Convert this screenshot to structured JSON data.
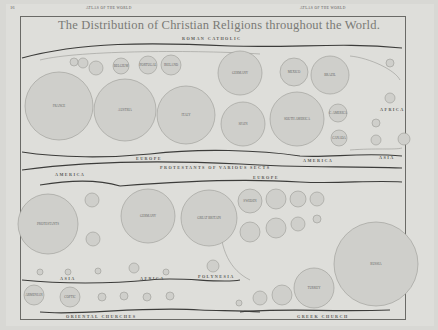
{
  "page": {
    "page_number": "16",
    "running_head_left": "ATLAS OF THE WORLD",
    "running_head_right": "ATLAS OF THE WORLD",
    "title": "The Distribution of Christian Religions throughout the World."
  },
  "sections": {
    "roman_catholic": "ROMAN CATHOLIC",
    "protestants": "PROTESTANTS OF VARIOUS SECTS",
    "oriental": "ORIENTAL CHURCHES",
    "greek": "GREEK CHURCH"
  },
  "region_labels": {
    "rc_europe": "EUROPE",
    "rc_america": "AMERICA",
    "rc_asia": "ASIA",
    "rc_africa": "AFRICA",
    "p_america": "AMERICA",
    "p_europe": "EUROPE",
    "p_asia": "ASIA",
    "p_africa": "AFRICA",
    "p_polynesia": "POLYNESIA"
  },
  "circles": {
    "roman_catholic": [
      {
        "label": "FRANCE",
        "cx": 59,
        "cy": 106,
        "r": 34
      },
      {
        "label": "AUSTRIA",
        "cx": 125,
        "cy": 110,
        "r": 31
      },
      {
        "label": "ITALY",
        "cx": 186,
        "cy": 115,
        "r": 29
      },
      {
        "label": "GERMANY",
        "cx": 240,
        "cy": 73,
        "r": 22
      },
      {
        "label": "SPAIN",
        "cx": 243,
        "cy": 124,
        "r": 22
      },
      {
        "label": "SOUTH AMERICA",
        "cx": 297,
        "cy": 119,
        "r": 27
      },
      {
        "label": "MEXICO",
        "cx": 294,
        "cy": 72,
        "r": 14
      },
      {
        "label": "BRAZIL",
        "cx": 330,
        "cy": 75,
        "r": 19
      },
      {
        "label": "BELGIUM",
        "cx": 121,
        "cy": 66,
        "r": 8
      },
      {
        "label": "PORTUGAL",
        "cx": 148,
        "cy": 65,
        "r": 9
      },
      {
        "label": "IRELAND",
        "cx": 171,
        "cy": 65,
        "r": 10
      },
      {
        "label": "SWITZ.",
        "cx": 96,
        "cy": 68,
        "r": 7
      },
      {
        "label": "",
        "cx": 83,
        "cy": 63,
        "r": 5
      },
      {
        "label": "",
        "cx": 74,
        "cy": 62,
        "r": 4
      },
      {
        "label": "C. AMERICA",
        "cx": 338,
        "cy": 113,
        "r": 9
      },
      {
        "label": "CANADA",
        "cx": 339,
        "cy": 138,
        "r": 8
      },
      {
        "label": "",
        "cx": 390,
        "cy": 63,
        "r": 4
      },
      {
        "label": "",
        "cx": 390,
        "cy": 98,
        "r": 5
      },
      {
        "label": "",
        "cx": 376,
        "cy": 123,
        "r": 4
      },
      {
        "label": "",
        "cx": 376,
        "cy": 140,
        "r": 5
      },
      {
        "label": "",
        "cx": 404,
        "cy": 139,
        "r": 6
      }
    ],
    "protestants": [
      {
        "label": "PROTESTANTS",
        "cx": 48,
        "cy": 224,
        "r": 30
      },
      {
        "label": "GERMANY",
        "cx": 148,
        "cy": 216,
        "r": 27
      },
      {
        "label": "GREAT BRITAIN",
        "cx": 209,
        "cy": 218,
        "r": 28
      },
      {
        "label": "",
        "cx": 92,
        "cy": 200,
        "r": 7
      },
      {
        "label": "",
        "cx": 93,
        "cy": 239,
        "r": 7
      },
      {
        "label": "SWEDEN",
        "cx": 250,
        "cy": 201,
        "r": 12
      },
      {
        "label": "",
        "cx": 276,
        "cy": 199,
        "r": 10
      },
      {
        "label": "",
        "cx": 298,
        "cy": 199,
        "r": 8
      },
      {
        "label": "",
        "cx": 317,
        "cy": 199,
        "r": 7
      },
      {
        "label": "",
        "cx": 250,
        "cy": 232,
        "r": 10
      },
      {
        "label": "",
        "cx": 276,
        "cy": 228,
        "r": 10
      },
      {
        "label": "",
        "cx": 298,
        "cy": 224,
        "r": 7
      },
      {
        "label": "",
        "cx": 317,
        "cy": 219,
        "r": 4
      },
      {
        "label": "",
        "cx": 40,
        "cy": 272,
        "r": 3
      },
      {
        "label": "",
        "cx": 68,
        "cy": 272,
        "r": 3
      },
      {
        "label": "",
        "cx": 98,
        "cy": 271,
        "r": 3
      },
      {
        "label": "",
        "cx": 134,
        "cy": 268,
        "r": 5
      },
      {
        "label": "",
        "cx": 166,
        "cy": 272,
        "r": 3
      },
      {
        "label": "",
        "cx": 213,
        "cy": 266,
        "r": 6
      }
    ],
    "oriental": [
      {
        "label": "ARMENIAN",
        "cx": 34,
        "cy": 295,
        "r": 10
      },
      {
        "label": "COPTIC",
        "cx": 70,
        "cy": 297,
        "r": 10
      },
      {
        "label": "",
        "cx": 102,
        "cy": 297,
        "r": 4
      },
      {
        "label": "",
        "cx": 124,
        "cy": 296,
        "r": 4
      },
      {
        "label": "",
        "cx": 147,
        "cy": 297,
        "r": 4
      },
      {
        "label": "",
        "cx": 170,
        "cy": 296,
        "r": 4
      }
    ],
    "greek": [
      {
        "label": "RUSSIA",
        "cx": 376,
        "cy": 264,
        "r": 42
      },
      {
        "label": "TURKEY",
        "cx": 314,
        "cy": 288,
        "r": 20
      },
      {
        "label": "",
        "cx": 282,
        "cy": 295,
        "r": 10
      },
      {
        "label": "",
        "cx": 260,
        "cy": 298,
        "r": 7
      },
      {
        "label": "",
        "cx": 239,
        "cy": 303,
        "r": 3
      }
    ]
  }
}
